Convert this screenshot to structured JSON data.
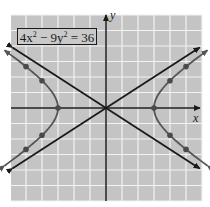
{
  "chart_data": {
    "type": "line",
    "title": "",
    "equation": {
      "text": "4x^2 - 9y^2 = 36",
      "parts": [
        "4x",
        "2",
        " − 9y",
        "2",
        " = 36"
      ]
    },
    "xlabel": "x",
    "ylabel": "y",
    "xlim": [
      -6,
      6
    ],
    "ylim": [
      -6,
      6
    ],
    "grid": true,
    "grid_step": 1,
    "tick_labels": [],
    "series": [
      {
        "name": "hyperbola right branch",
        "kind": "curve",
        "equation": "4x^2 - 9y^2 = 36",
        "marked_points": [
          [
            3,
            0
          ],
          [
            4,
            1.76
          ],
          [
            5,
            2.67
          ],
          [
            4,
            -1.76
          ],
          [
            5,
            -2.67
          ]
        ]
      },
      {
        "name": "hyperbola left branch",
        "kind": "curve",
        "equation": "4x^2 - 9y^2 = 36",
        "marked_points": [
          [
            -3,
            0
          ],
          [
            -4,
            1.76
          ],
          [
            -5,
            2.67
          ],
          [
            -4,
            -1.76
          ],
          [
            -5,
            -2.67
          ]
        ]
      },
      {
        "name": "asymptote",
        "kind": "line",
        "equation": "y = (2/3)x"
      },
      {
        "name": "asymptote",
        "kind": "line",
        "equation": "y = -(2/3)x"
      }
    ],
    "vertices": [
      [
        -3,
        0
      ],
      [
        3,
        0
      ]
    ],
    "colors": {
      "background": "#c4c4c4",
      "grid": "#f2f2f2",
      "axes": "#1a1a1a",
      "asymptote": "#1a1a1a",
      "curve": "#555555",
      "point": "#4a4a4a"
    }
  }
}
